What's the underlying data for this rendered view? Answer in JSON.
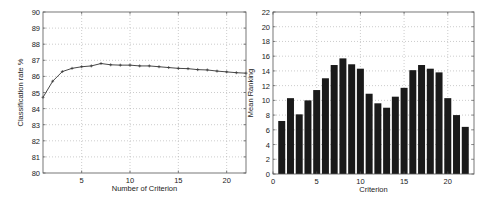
{
  "chart_data": [
    {
      "type": "line",
      "title": "",
      "xlabel": "Number of Criterion",
      "ylabel": "Classification rate %",
      "xlim": [
        1,
        22
      ],
      "ylim": [
        80,
        90
      ],
      "xticks": [
        5,
        10,
        15,
        20
      ],
      "yticks": [
        80,
        81,
        82,
        83,
        84,
        85,
        86,
        87,
        88,
        89,
        90
      ],
      "grid": true,
      "x": [
        1,
        2,
        3,
        4,
        5,
        6,
        7,
        8,
        9,
        10,
        11,
        12,
        13,
        14,
        15,
        16,
        17,
        18,
        19,
        20,
        21,
        22
      ],
      "series": [
        {
          "name": "Classification rate",
          "values": [
            84.7,
            85.7,
            86.3,
            86.5,
            86.6,
            86.65,
            86.8,
            86.72,
            86.7,
            86.7,
            86.65,
            86.65,
            86.6,
            86.55,
            86.5,
            86.48,
            86.42,
            86.4,
            86.33,
            86.28,
            86.23,
            86.2
          ]
        }
      ]
    },
    {
      "type": "bar",
      "title": "",
      "xlabel": "Criterion",
      "ylabel": "Mean Ranking",
      "xlim": [
        0,
        23
      ],
      "ylim": [
        0,
        22
      ],
      "xticks": [
        0,
        5,
        10,
        15,
        20
      ],
      "yticks": [
        0,
        2,
        4,
        6,
        8,
        10,
        12,
        14,
        16,
        18,
        20,
        22
      ],
      "grid": true,
      "categories": [
        1,
        2,
        3,
        4,
        5,
        6,
        7,
        8,
        9,
        10,
        11,
        12,
        13,
        14,
        15,
        16,
        17,
        18,
        19,
        20,
        21,
        22
      ],
      "values": [
        7.2,
        10.3,
        8.1,
        10.0,
        11.4,
        13.0,
        14.8,
        15.7,
        14.9,
        14.3,
        10.9,
        9.6,
        9.0,
        10.5,
        11.7,
        14.1,
        14.8,
        14.3,
        13.8,
        10.3,
        8.0,
        6.4
      ]
    }
  ]
}
